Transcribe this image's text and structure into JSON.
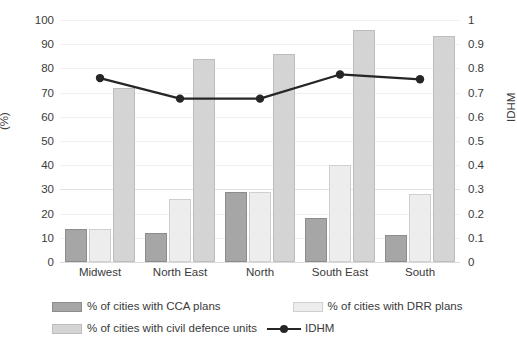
{
  "chart_data": {
    "type": "bar",
    "title": "",
    "categories": [
      "Midwest",
      "North East",
      "North",
      "South East",
      "South"
    ],
    "series": [
      {
        "name": "% of cities with CCA plans",
        "key": "cca",
        "axis": "left",
        "type": "bar",
        "color": "#a6a6a6",
        "values": [
          13.5,
          12,
          29,
          18,
          11
        ]
      },
      {
        "name": "% of cities with DRR plans",
        "key": "drr",
        "axis": "left",
        "type": "bar",
        "color": "#ededed",
        "values": [
          13.5,
          26,
          29,
          40,
          28
        ]
      },
      {
        "name": "% of cities with civil defence units",
        "key": "cdu",
        "axis": "left",
        "type": "bar",
        "color": "#d4d4d4",
        "values": [
          72,
          84,
          86,
          96,
          93.5
        ]
      },
      {
        "name": "IDHM",
        "key": "idhm",
        "axis": "right",
        "type": "line",
        "color": "#262626",
        "values": [
          0.76,
          0.675,
          0.675,
          0.775,
          0.755
        ]
      }
    ],
    "xlabel": "",
    "ylabel": "(%)",
    "y2label": "IDHM",
    "ylim": [
      0,
      100
    ],
    "y2lim": [
      0,
      1
    ],
    "yticks": [
      "0",
      "10",
      "20",
      "30",
      "40",
      "50",
      "60",
      "70",
      "80",
      "90",
      "100"
    ],
    "y2ticks": [
      "0",
      "0.1",
      "0.2",
      "0.3",
      "0.4",
      "0.5",
      "0.6",
      "0.7",
      "0.8",
      "0.9",
      "1"
    ],
    "grid": true,
    "legend_position": "bottom"
  },
  "legend": {
    "entries": [
      {
        "label": "% of cities with CCA plans",
        "style": "bar",
        "swatch": "s-cca"
      },
      {
        "label": "% of cities with DRR plans",
        "style": "bar",
        "swatch": "s-drr"
      },
      {
        "label": "% of cities with civil defence units",
        "style": "bar",
        "swatch": "s-cdu"
      },
      {
        "label": "IDHM",
        "style": "line",
        "swatch": "s-line"
      }
    ]
  }
}
